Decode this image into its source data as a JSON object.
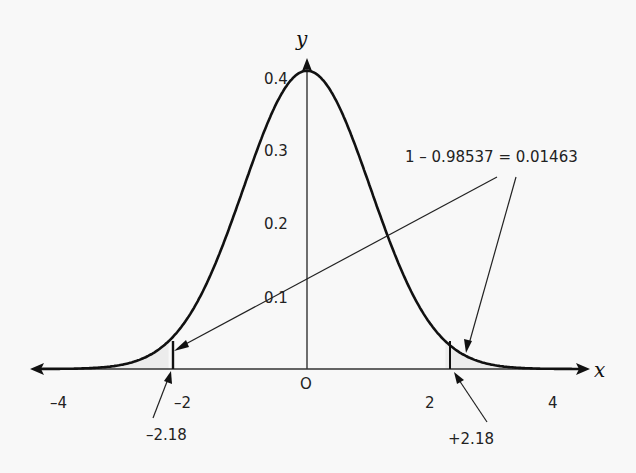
{
  "chart_data": {
    "type": "line",
    "title": "",
    "xlabel": "x",
    "ylabel": "y",
    "xlim": [
      -4.2,
      4.3
    ],
    "ylim": [
      0,
      0.4
    ],
    "x_ticks": [
      "-4",
      "-2",
      "O",
      "2",
      "4"
    ],
    "y_ticks": [
      "0.1",
      "0.2",
      "0.3",
      "0.4"
    ],
    "series": [
      {
        "name": "standard normal density",
        "function": "y = (1/sqrt(2*pi)) * exp(-x^2/2)",
        "x": [
          -4,
          -3,
          -2.18,
          -2,
          -1,
          0,
          1,
          2,
          2.18,
          3,
          4
        ],
        "values": [
          0.0001,
          0.0044,
          0.0371,
          0.054,
          0.242,
          0.399,
          0.242,
          0.054,
          0.0371,
          0.0044,
          0.0001
        ]
      }
    ],
    "annotations": [
      {
        "text": "1 – 0.98537 = 0.01463",
        "points_to": [
          "tail left of -2.18",
          "tail right of +2.18"
        ]
      },
      {
        "text": "–2.18",
        "points_to": "x = -2.18"
      },
      {
        "text": "+2.18",
        "points_to": "x = 2.18"
      }
    ],
    "shaded_regions": [
      [
        -4.2,
        -2.18
      ],
      [
        2.18,
        4.3
      ]
    ],
    "grid": false,
    "legend": "none"
  },
  "labels": {
    "y_axis": "y",
    "x_axis": "x",
    "y04": "0.4",
    "y03": "0.3",
    "y02": "0.2",
    "y01": "0.1",
    "xm4": "–4",
    "xm2": "–2",
    "x0": "O",
    "x2": "2",
    "x4": "4",
    "neg_cut": "–2.18",
    "pos_cut": "+2.18",
    "tail_prob": "1 – 0.98537 = 0.01463"
  }
}
